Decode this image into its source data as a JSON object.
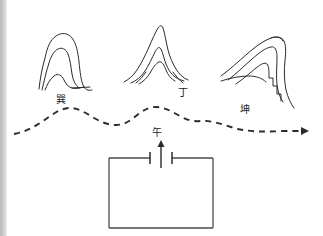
{
  "figure": {
    "background_color": "#ffffff",
    "ink_color": "#2b2b2b",
    "scan_edge_color": "#c9c9c9"
  },
  "labels": {
    "xun": "巽",
    "ding": "丁",
    "kun": "坤",
    "wu": "午"
  },
  "mountains": [
    {
      "name": "left-mountain",
      "label": "巽",
      "form": "rounded-dome",
      "position": "left",
      "ridge_contours": 3
    },
    {
      "name": "center-mountain",
      "label": "丁",
      "form": "pointed-peak",
      "position": "center",
      "ridge_contours": 3
    },
    {
      "name": "right-mountain",
      "label": "坤",
      "form": "leaning-asymmetric-peak",
      "position": "right",
      "ridge_contours": 3
    }
  ],
  "dragon_vein": {
    "name": "dashed-undulating-line",
    "style": "dashed",
    "direction": "left-to-right",
    "arrowhead": "right-end"
  },
  "site": {
    "name": "rectangular-plot",
    "gate_label": "午",
    "gate_position": "top-center",
    "orientation_arrow": "up"
  }
}
